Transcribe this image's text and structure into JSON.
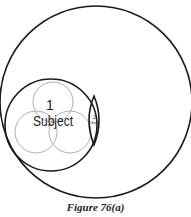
{
  "figure": {
    "caption": "Figure 76(a)",
    "labels": {
      "subject_number": "1",
      "subject": "Subject",
      "object_number": "2",
      "object": "Object"
    },
    "colors": {
      "outline": "#1a1a1a",
      "inner_circles": "#9a9a9a",
      "background": "#ffffff"
    }
  }
}
